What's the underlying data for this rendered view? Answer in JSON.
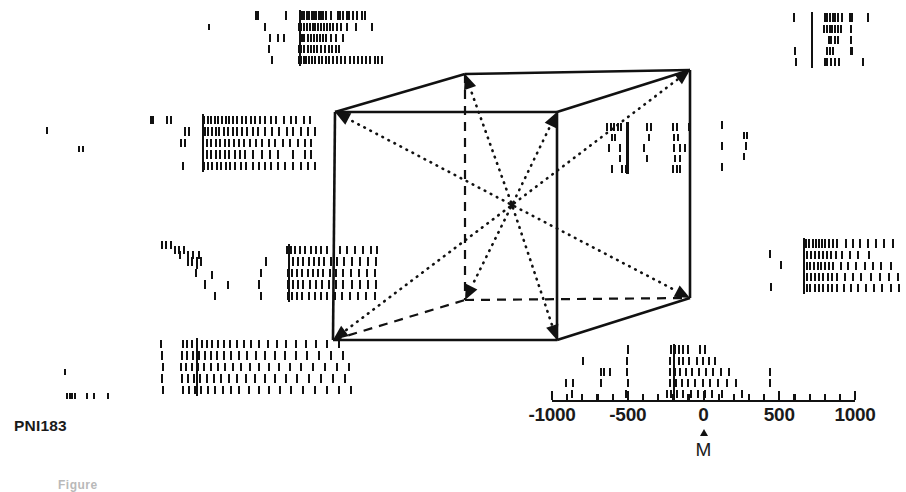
{
  "figure": {
    "panel_id": "PNI183",
    "caption_stub": "Figure",
    "kind": "neural-raster-cube",
    "background_color": "#ffffff",
    "ink_color": "#111111"
  },
  "axis": {
    "name": "time-axis",
    "tick_labels": [
      "-1000",
      "-500",
      "0",
      "500",
      "1000"
    ],
    "tick_values": [
      -1000,
      -500,
      0,
      500,
      1000
    ],
    "minor_ticks_per_major": 5,
    "range": [
      -1000,
      1000
    ],
    "units": "ms",
    "marker_label": "M",
    "marker_value": 0,
    "px_left": 552,
    "px_right": 855,
    "px_y": 400
  },
  "cube": {
    "name": "direction-cube",
    "center_px": [
      512,
      205
    ],
    "vertices": {
      "front_top_left": [
        335,
        112
      ],
      "front_top_right": [
        557,
        112
      ],
      "front_bottom_left": [
        333,
        340
      ],
      "front_bottom_right": [
        557,
        340
      ],
      "back_top_left": [
        465,
        74
      ],
      "back_top_right": [
        690,
        70
      ],
      "back_bottom_left": [
        465,
        300
      ],
      "back_bottom_right": [
        690,
        298
      ]
    },
    "solid_edges": [
      [
        "front_top_left",
        "front_top_right"
      ],
      [
        "front_top_left",
        "front_bottom_left"
      ],
      [
        "front_bottom_left",
        "front_bottom_right"
      ],
      [
        "front_top_right",
        "front_bottom_right"
      ],
      [
        "front_top_left",
        "back_top_left"
      ],
      [
        "front_top_right",
        "back_top_right"
      ],
      [
        "back_top_left",
        "back_top_right"
      ],
      [
        "back_top_right",
        "back_bottom_right"
      ],
      [
        "front_bottom_right",
        "back_bottom_right"
      ]
    ],
    "dashed_edges": [
      [
        "back_top_left",
        "back_bottom_left"
      ],
      [
        "back_bottom_left",
        "back_bottom_right"
      ],
      [
        "front_bottom_left",
        "back_bottom_left"
      ]
    ],
    "arrows_from_center_to": [
      "front_top_left",
      "front_top_right",
      "front_bottom_left",
      "front_bottom_right",
      "back_top_left",
      "back_top_right",
      "back_bottom_left",
      "back_bottom_right"
    ],
    "arrow_style": "dotted-with-solid-head"
  },
  "rasters": [
    {
      "name": "raster-back-top-left",
      "corner": "back_top_left",
      "x": 252,
      "y": 10,
      "w": 156,
      "h": 56,
      "rows": 5,
      "marker_x_frac": 0.3,
      "trains": [
        [
          0.02,
          0.03,
          0.21,
          0.3,
          0.315,
          0.33,
          0.345,
          0.36,
          0.375,
          0.39,
          0.405,
          0.42,
          0.435,
          0.45,
          0.47,
          0.5,
          0.545,
          0.56,
          0.575,
          0.6,
          0.615,
          0.64,
          0.665,
          0.7,
          0.72
        ],
        [
          0.08,
          0.295,
          0.31,
          0.325,
          0.345,
          0.365,
          0.385,
          0.4,
          0.415,
          0.435,
          0.455,
          0.475,
          0.495,
          0.515,
          0.54,
          0.565,
          0.6,
          0.66,
          0.76
        ],
        [
          0.11,
          0.16,
          0.2,
          0.3,
          0.315,
          0.33,
          0.35,
          0.37,
          0.39,
          0.41,
          0.43,
          0.45,
          0.47,
          0.5,
          0.53,
          0.58
        ],
        [
          0.1,
          0.295,
          0.31,
          0.33,
          0.35,
          0.37,
          0.39,
          0.41,
          0.435,
          0.46,
          0.485,
          0.505,
          0.53,
          0.55
        ],
        [
          0.12,
          0.295,
          0.31,
          0.325,
          0.34,
          0.36,
          0.38,
          0.4,
          0.42,
          0.445,
          0.47,
          0.49,
          0.515,
          0.54,
          0.565,
          0.59,
          0.62,
          0.65,
          0.675,
          0.7,
          0.725,
          0.75,
          0.78,
          0.8,
          0.825
        ]
      ]
    },
    {
      "name": "raster-back-top-right",
      "corner": "back_top_right",
      "x": 792,
      "y": 12,
      "w": 106,
      "h": 56,
      "rows": 5,
      "marker_x_frac": 0.18,
      "trains": [
        [
          0.01,
          0.175,
          0.3,
          0.325,
          0.35,
          0.375,
          0.4,
          0.425,
          0.46,
          0.54,
          0.555,
          0.71
        ],
        [
          0.175,
          0.295,
          0.32,
          0.345,
          0.37,
          0.395,
          0.425,
          0.45,
          0.545
        ],
        [
          0.175,
          0.335,
          0.36,
          0.4,
          0.425,
          0.545
        ],
        [
          0.02,
          0.175,
          0.325,
          0.35,
          0.375,
          0.545,
          0.56
        ],
        [
          0.03,
          0.175,
          0.3,
          0.325,
          0.36,
          0.4,
          0.43,
          0.665
        ]
      ]
    },
    {
      "name": "raster-front-top-left",
      "corner": "front_top_left",
      "x": 148,
      "y": 114,
      "w": 180,
      "h": 58,
      "rows": 5,
      "marker_x_frac": 0.3,
      "trains": [
        [
          0.01,
          0.02,
          0.1,
          0.12,
          0.305,
          0.325,
          0.345,
          0.365,
          0.385,
          0.405,
          0.425,
          0.445,
          0.465,
          0.49,
          0.515,
          0.54,
          0.565,
          0.59,
          0.615,
          0.645,
          0.675,
          0.705,
          0.75,
          0.79,
          0.815,
          0.86,
          0.895
        ],
        [
          0.2,
          0.22,
          0.31,
          0.33,
          0.35,
          0.37,
          0.39,
          0.415,
          0.44,
          0.465,
          0.49,
          0.515,
          0.545,
          0.575,
          0.605,
          0.645,
          0.685,
          0.72,
          0.765,
          0.8,
          0.845,
          0.885,
          0.92
        ],
        [
          0.18,
          0.2,
          0.3,
          0.32,
          0.345,
          0.37,
          0.395,
          0.42,
          0.445,
          0.47,
          0.5,
          0.53,
          0.56,
          0.595,
          0.63,
          0.665,
          0.7,
          0.745,
          0.785,
          0.825,
          0.865,
          0.9
        ],
        [
          0.3,
          0.32,
          0.345,
          0.37,
          0.395,
          0.42,
          0.445,
          0.475,
          0.505,
          0.535,
          0.58,
          0.625,
          0.67,
          0.715,
          0.8,
          0.865,
          0.9
        ],
        [
          0.19,
          0.305,
          0.325,
          0.35,
          0.375,
          0.4,
          0.425,
          0.45,
          0.48,
          0.51,
          0.54,
          0.575,
          0.61,
          0.645,
          0.68,
          0.715,
          0.755,
          0.8,
          0.845,
          0.885,
          0.92
        ]
      ]
    },
    {
      "name": "raster-front-top-right",
      "corner": "front_top_right",
      "x": 600,
      "y": 122,
      "w": 120,
      "h": 52,
      "rows": 5,
      "marker_x_frac": 0.22,
      "trains": [
        [
          0.05,
          0.08,
          0.11,
          0.14,
          0.165,
          0.38,
          0.42,
          0.6,
          0.63,
          0.73
        ],
        [
          0.09,
          0.12,
          0.4,
          0.61,
          0.64
        ],
        [
          0.07,
          0.155,
          0.36,
          0.61,
          0.66,
          0.7
        ],
        [
          0.155,
          0.385,
          0.62,
          0.66
        ],
        [
          0.09,
          0.175,
          0.21,
          0.6,
          0.63,
          0.66
        ]
      ]
    },
    {
      "name": "raster-front-bottom-left",
      "corner": "front_bottom_left",
      "x": 170,
      "y": 244,
      "w": 210,
      "h": 58,
      "rows": 5,
      "marker_x_frac": 0.56,
      "trains": [
        [
          0.02,
          0.04,
          0.06,
          0.55,
          0.57,
          0.59,
          0.615,
          0.64,
          0.665,
          0.69,
          0.715,
          0.745,
          0.775,
          0.805,
          0.84,
          0.875,
          0.915,
          0.95,
          0.98
        ],
        [
          0.08,
          0.1,
          0.125,
          0.145,
          0.45,
          0.56,
          0.58,
          0.605,
          0.63,
          0.655,
          0.68,
          0.705,
          0.73,
          0.76,
          0.79,
          0.825,
          0.86,
          0.9,
          0.94,
          0.975
        ],
        [
          0.12,
          0.43,
          0.555,
          0.575,
          0.6,
          0.625,
          0.65,
          0.675,
          0.7,
          0.725,
          0.755,
          0.785,
          0.82,
          0.855,
          0.895,
          0.935,
          0.97
        ],
        [
          0.16,
          0.42,
          0.555,
          0.58,
          0.605,
          0.63,
          0.66,
          0.69,
          0.72,
          0.75,
          0.785,
          0.82,
          0.86,
          0.9,
          0.94,
          0.975
        ],
        [
          0.21,
          0.43,
          0.555,
          0.575,
          0.6,
          0.625,
          0.655,
          0.685,
          0.715,
          0.745,
          0.78,
          0.815,
          0.85,
          0.89,
          0.93,
          0.97
        ]
      ]
    },
    {
      "name": "raster-back-bottom-right",
      "corner": "back_bottom_right",
      "x": 798,
      "y": 238,
      "w": 104,
      "h": 56,
      "rows": 5,
      "marker_x_frac": 0.05,
      "trains": [
        [
          0.045,
          0.07,
          0.1,
          0.13,
          0.16,
          0.19,
          0.22,
          0.25,
          0.29,
          0.33,
          0.37,
          0.45,
          0.52,
          0.59,
          0.66,
          0.74,
          0.82,
          0.9
        ],
        [
          0.045,
          0.08,
          0.115,
          0.15,
          0.19,
          0.23,
          0.27,
          0.31,
          0.36,
          0.41,
          0.49,
          0.57,
          0.67
        ],
        [
          0.045,
          0.075,
          0.11,
          0.145,
          0.18,
          0.215,
          0.25,
          0.29,
          0.33,
          0.4,
          0.47,
          0.55,
          0.63,
          0.71,
          0.79,
          0.88
        ],
        [
          0.045,
          0.08,
          0.115,
          0.155,
          0.195,
          0.235,
          0.275,
          0.32,
          0.365,
          0.44,
          0.52,
          0.6,
          0.69,
          0.78,
          0.87,
          0.95
        ],
        [
          0.045,
          0.075,
          0.11,
          0.15,
          0.19,
          0.23,
          0.275,
          0.32,
          0.37,
          0.43,
          0.5,
          0.57,
          0.645,
          0.72,
          0.8,
          0.88,
          0.96
        ]
      ]
    },
    {
      "name": "raster-front-bottom-right",
      "corner": "front_bottom_right",
      "x": 560,
      "y": 344,
      "w": 240,
      "h": 56,
      "rows": 5,
      "marker_x_frac": 0.47,
      "trains": [
        [
          0.28,
          0.46,
          0.475,
          0.49,
          0.51,
          0.53,
          0.58,
          0.6
        ],
        [
          0.09,
          0.275,
          0.455,
          0.47,
          0.49,
          0.51,
          0.535,
          0.565,
          0.59,
          0.615,
          0.64
        ],
        [
          0.165,
          0.18,
          0.205,
          0.275,
          0.455,
          0.475,
          0.495,
          0.52,
          0.545,
          0.575,
          0.605,
          0.635,
          0.665,
          0.7,
          0.87
        ],
        [
          0.02,
          0.05,
          0.165,
          0.28,
          0.455,
          0.48,
          0.505,
          0.53,
          0.56,
          0.59,
          0.62,
          0.655,
          0.69,
          0.73,
          0.87
        ],
        [
          0.045,
          0.27,
          0.44,
          0.46,
          0.485,
          0.51,
          0.54,
          0.57,
          0.6,
          0.63,
          0.67,
          0.755
        ]
      ]
    },
    {
      "name": "raster-back-bottom-left",
      "corner": "back_bottom_left",
      "x": 158,
      "y": 338,
      "w": 200,
      "h": 58,
      "rows": 5,
      "marker_x_frac": 0.19,
      "trains": [
        [
          0.01,
          0.12,
          0.14,
          0.165,
          0.19,
          0.215,
          0.24,
          0.265,
          0.295,
          0.325,
          0.355,
          0.39,
          0.425,
          0.46,
          0.5,
          0.545,
          0.59,
          0.635,
          0.685,
          0.735,
          0.785,
          0.84,
          0.9
        ],
        [
          0.015,
          0.115,
          0.14,
          0.17,
          0.2,
          0.23,
          0.26,
          0.29,
          0.325,
          0.36,
          0.4,
          0.44,
          0.485,
          0.53,
          0.58,
          0.63,
          0.685,
          0.74,
          0.8,
          0.86,
          0.92
        ],
        [
          0.02,
          0.11,
          0.135,
          0.165,
          0.195,
          0.225,
          0.26,
          0.295,
          0.33,
          0.37,
          0.41,
          0.455,
          0.5,
          0.55,
          0.6,
          0.655,
          0.71,
          0.77,
          0.83,
          0.89,
          0.95
        ],
        [
          0.015,
          0.115,
          0.145,
          0.175,
          0.205,
          0.24,
          0.275,
          0.31,
          0.35,
          0.39,
          0.435,
          0.48,
          0.53,
          0.58,
          0.635,
          0.69,
          0.75,
          0.81,
          0.87,
          0.93
        ],
        [
          0.02,
          0.12,
          0.15,
          0.18,
          0.21,
          0.245,
          0.28,
          0.32,
          0.36,
          0.4,
          0.45,
          0.5,
          0.55,
          0.605,
          0.66,
          0.72,
          0.78,
          0.84,
          0.9,
          0.96
        ]
      ]
    },
    {
      "name": "raster-outlier-far-left-upper",
      "corner": "none",
      "x": 40,
      "y": 126,
      "w": 60,
      "h": 46,
      "rows": 5,
      "marker_x_frac": -1,
      "trains": [
        [
          0.1
        ],
        [],
        [
          0.63,
          0.7
        ],
        [],
        []
      ]
    },
    {
      "name": "raster-outlier-far-left-lower",
      "corner": "none",
      "x": 40,
      "y": 360,
      "w": 120,
      "h": 40,
      "rows": 5,
      "marker_x_frac": -1,
      "trains": [
        [],
        [
          0.2
        ],
        [],
        [],
        [
          0.22,
          0.24,
          0.26,
          0.28,
          0.38,
          0.44,
          0.56
        ]
      ]
    },
    {
      "name": "raster-outlier-mid-left",
      "corner": "none",
      "x": 150,
      "y": 240,
      "w": 110,
      "h": 50,
      "rows": 5,
      "marker_x_frac": -1,
      "trains": [
        [
          0.1,
          0.14,
          0.18
        ],
        [
          0.26,
          0.34,
          0.38,
          0.44
        ],
        [
          0.42
        ],
        [
          0.55
        ],
        [
          0.7
        ]
      ]
    },
    {
      "name": "raster-outlier-top-strip",
      "corner": "none",
      "x": 196,
      "y": 14,
      "w": 40,
      "h": 44,
      "rows": 5,
      "marker_x_frac": -1,
      "trains": [
        [],
        [
          0.3
        ],
        [],
        [],
        []
      ]
    },
    {
      "name": "raster-outlier-right-of-cube",
      "corner": "none",
      "x": 700,
      "y": 120,
      "w": 70,
      "h": 52,
      "rows": 5,
      "marker_x_frac": -1,
      "trains": [
        [
          0.3
        ],
        [
          0.62,
          0.66
        ],
        [
          0.3,
          0.64
        ],
        [
          0.62
        ],
        [
          0.3
        ]
      ]
    },
    {
      "name": "raster-outlier-left-of-right-raster",
      "corner": "none",
      "x": 760,
      "y": 238,
      "w": 34,
      "h": 54,
      "rows": 5,
      "marker_x_frac": -1,
      "trains": [
        [],
        [
          0.25
        ],
        [
          0.6
        ],
        [],
        [
          0.3
        ]
      ]
    }
  ]
}
